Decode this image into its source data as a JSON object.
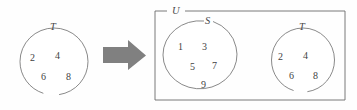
{
  "figure": {
    "background_color": "#fefefe",
    "stroke_color": "#6b6b6b",
    "arrow_color": "#808080",
    "text_color": "#3f3f3f"
  },
  "left_diagram": {
    "set_label": "T",
    "elements": [
      "2",
      "4",
      "6",
      "8"
    ],
    "shape": "circle"
  },
  "arrow": {
    "icon": "arrow-right-icon",
    "direction": "right",
    "color": "#808080"
  },
  "right_diagram": {
    "universe_label": "U",
    "sets": [
      {
        "label": "S",
        "elements": [
          "1",
          "3",
          "5",
          "7",
          "9"
        ],
        "shape": "ellipse"
      },
      {
        "label": "T",
        "elements": [
          "2",
          "4",
          "6",
          "8"
        ],
        "shape": "circle"
      }
    ]
  }
}
